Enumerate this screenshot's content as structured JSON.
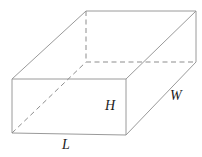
{
  "figure": {
    "name": "rectangular-prism",
    "caption": "",
    "background_color": "#ffffff",
    "solid_edge_color": "#9a9a9a",
    "hidden_edge_color": "#8d8d8d",
    "label_color": "#1b1b1b"
  },
  "labels": {
    "height": "H",
    "length": "L",
    "width": "W"
  },
  "geometry": {
    "front_face": {
      "top_left": {
        "x": 12,
        "y": 79
      },
      "top_right": {
        "x": 126,
        "y": 79
      },
      "bottom_right": {
        "x": 126,
        "y": 135
      },
      "bottom_left": {
        "x": 12,
        "y": 133
      }
    },
    "back_face": {
      "top_left": {
        "x": 86,
        "y": 11
      },
      "top_right": {
        "x": 196,
        "y": 11
      },
      "bottom_right": {
        "x": 196,
        "y": 62
      },
      "bottom_left": {
        "x": 86,
        "y": 62
      }
    },
    "solid_edges": [
      {
        "name": "front-top",
        "d": "M 12 79 L 126 79"
      },
      {
        "name": "front-right",
        "d": "M 126 79 L 126 135"
      },
      {
        "name": "front-bottom",
        "d": "M 126 135 L 12 133"
      },
      {
        "name": "front-left",
        "d": "M 12 133 L 12 79"
      },
      {
        "name": "back-top",
        "d": "M 86 11 L 196 11"
      },
      {
        "name": "back-right",
        "d": "M 196 11 L 196 62"
      },
      {
        "name": "connect-top-left",
        "d": "M 12 79 L 86 11"
      },
      {
        "name": "connect-top-right",
        "d": "M 126 79 L 196 11"
      },
      {
        "name": "connect-bottom-right",
        "d": "M 126 135 L 196 62"
      }
    ],
    "hidden_edges": [
      {
        "name": "back-left-vertical",
        "d": "M 86 11 L 86 62"
      },
      {
        "name": "back-bottom",
        "d": "M 86 62 L 196 62"
      },
      {
        "name": "connect-bottom-left",
        "d": "M 12 133 L 86 62"
      }
    ]
  }
}
